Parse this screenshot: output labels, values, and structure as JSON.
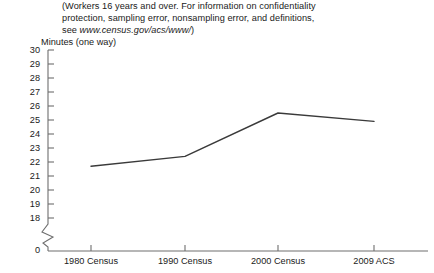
{
  "note": {
    "line1": "(Workers 16 years and over. For information on confidentiality",
    "line2": "protection, sampling error, nonsampling error, and definitions,",
    "line3_prefix": "see ",
    "line3_url": "www.census.gov/acs/www/",
    "line3_suffix": ")"
  },
  "chart_data": {
    "type": "line",
    "title": "",
    "subtitle": "",
    "xlabel": "",
    "ylabel": "Minutes (one way)",
    "categories": [
      "1980 Census",
      "1990 Census",
      "2000 Census",
      "2009 ACS"
    ],
    "values": [
      21.7,
      22.4,
      25.5,
      24.9
    ],
    "series": [
      {
        "name": "Mean travel time to work",
        "values": [
          21.7,
          22.4,
          25.5,
          24.9
        ]
      }
    ],
    "ytick_labels": [
      "30",
      "29",
      "28",
      "27",
      "26",
      "25",
      "24",
      "23",
      "22",
      "21",
      "20",
      "19",
      "18",
      "0"
    ],
    "ytick_values": [
      30,
      29,
      28,
      27,
      26,
      25,
      24,
      23,
      22,
      21,
      20,
      19,
      18,
      0
    ],
    "ylim": [
      18,
      30
    ],
    "axis_break": true,
    "axis_break_label": "0",
    "grid": false,
    "legend": "none",
    "line_color": "#3a3a3a",
    "axis_color": "#6e6e6e"
  }
}
